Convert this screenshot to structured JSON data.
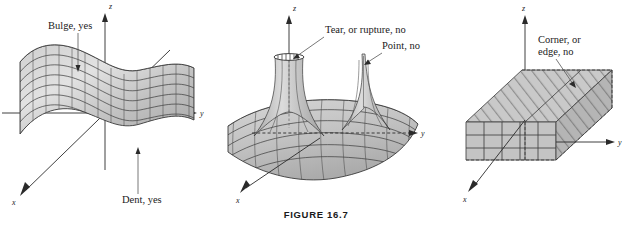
{
  "figure": {
    "caption": "FIGURE 16.7",
    "panels": [
      {
        "id": "left",
        "name": "smooth-saddle-surface",
        "axes": {
          "x": "x",
          "y": "y",
          "z": "z"
        },
        "callouts": [
          {
            "text": "Bulge, yes"
          },
          {
            "text": "Dent, yes"
          }
        ]
      },
      {
        "id": "middle",
        "name": "spiked-surface",
        "axes": {
          "x": "x",
          "y": "y",
          "z": "z"
        },
        "callouts": [
          {
            "text": "Tear, or rupture, no"
          },
          {
            "text": "Point, no"
          }
        ]
      },
      {
        "id": "right",
        "name": "box-solid",
        "axes": {
          "x": "x",
          "y": "y",
          "z": "z"
        },
        "callouts": [
          {
            "text": "Corner, or"
          },
          {
            "text": "edge, no"
          }
        ]
      }
    ]
  },
  "colors": {
    "surface_light": "#d8d8d8",
    "surface_mid": "#bfbfbf",
    "surface_dark": "#9d9d9d",
    "ink": "#1a1a1a",
    "leader": "#555555",
    "background": "#ffffff"
  }
}
